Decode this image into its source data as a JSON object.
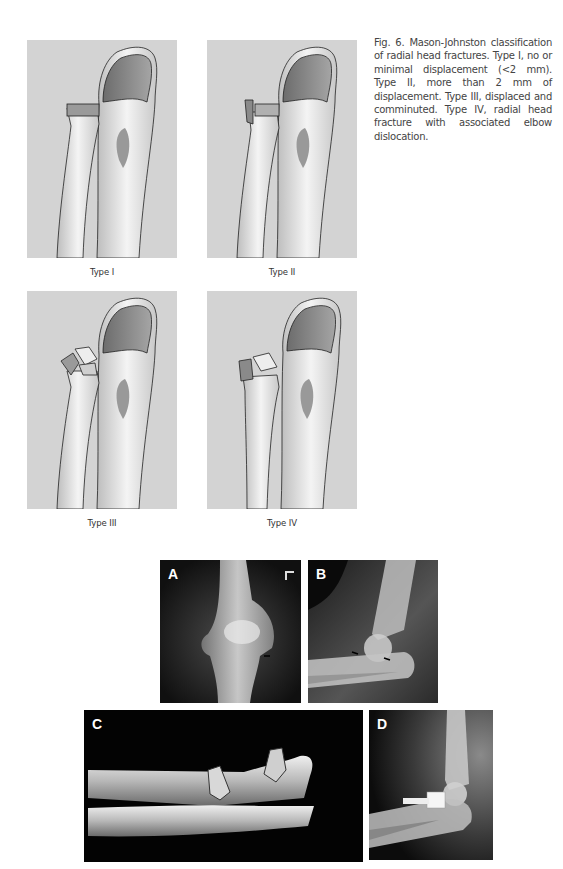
{
  "figure": {
    "caption": "Fig. 6. Mason-Johnston classification of radial head fractures. Type I, no or minimal displacement (<2 mm). Type II, more than 2 mm of displacement. Type III, displaced and comminuted. Type IV, radial head fracture with associated elbow dislocation.",
    "illustrations": [
      {
        "label": "Type I"
      },
      {
        "label": "Type II"
      },
      {
        "label": "Type III"
      },
      {
        "label": "Type IV"
      }
    ],
    "panels": [
      {
        "letter": "A",
        "description": "AP elbow radiograph"
      },
      {
        "letter": "B",
        "description": "Lateral elbow radiograph with arrows"
      },
      {
        "letter": "C",
        "description": "3D CT reconstruction of forearm"
      },
      {
        "letter": "D",
        "description": "Lateral radiograph with radial head prosthesis"
      }
    ]
  },
  "colors": {
    "illustration_bg": "#d3d3d3",
    "xray_bg": "#050505",
    "caption_text": "#444444"
  }
}
